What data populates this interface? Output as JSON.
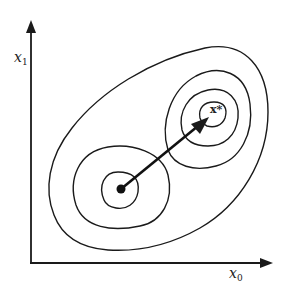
{
  "figure": {
    "type": "contour-diagram",
    "axes": {
      "x_label": {
        "var": "x",
        "sub": "0"
      },
      "y_label": {
        "var": "x",
        "sub": "1"
      }
    },
    "points": {
      "start": {
        "label": "",
        "marker": "filled-dot"
      },
      "optimum": {
        "label": "x*",
        "marker": "arrow-target"
      }
    },
    "contours": {
      "outer_count": 1,
      "left_basin_rings": 2,
      "right_basin_rings": 3
    },
    "colors": {
      "ink": "#1a1a1a",
      "background": "#ffffff"
    }
  },
  "labels": {
    "x_axis_var": "x",
    "x_axis_sub": "0",
    "y_axis_var": "x",
    "y_axis_sub": "1",
    "optimum": "x*"
  }
}
